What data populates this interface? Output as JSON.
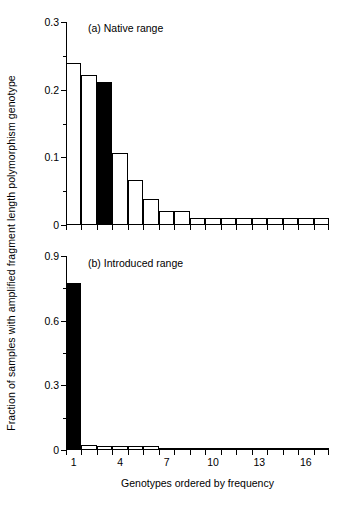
{
  "figure": {
    "ylabel": "Fraction of samples with amplified fragment length polymorphism genotype",
    "xlabel": "Genotypes ordered by frequency"
  },
  "chart_data": [
    {
      "type": "bar",
      "panel": "a",
      "tag": "(a)  Native range",
      "title": "Native range",
      "xlabel": "Genotypes ordered by frequency",
      "ylabel": "Fraction of samples with amplified fragment length polymorphism genotype",
      "categories": [
        1,
        2,
        3,
        4,
        5,
        6,
        7,
        8,
        9,
        10,
        11,
        12,
        13,
        14,
        15,
        16,
        17
      ],
      "values": [
        0.24,
        0.222,
        0.212,
        0.107,
        0.067,
        0.038,
        0.02,
        0.02,
        0.01,
        0.01,
        0.01,
        0.01,
        0.01,
        0.01,
        0.01,
        0.01,
        0.01
      ],
      "fills": [
        "open",
        "open",
        "solid",
        "open",
        "open",
        "open",
        "open",
        "open",
        "open",
        "open",
        "open",
        "open",
        "open",
        "open",
        "open",
        "open",
        "open"
      ],
      "ylim": [
        0,
        0.3
      ],
      "ymajor": [
        0,
        0.1,
        0.2,
        0.3
      ],
      "yticklabels": [
        "0",
        "0.1",
        "0.2",
        "0.3"
      ],
      "yminor": [
        0.05,
        0.15,
        0.25
      ],
      "xlim": [
        0.5,
        17.5
      ],
      "xticks": [
        1,
        2,
        3,
        4,
        5,
        6,
        7,
        8,
        9,
        10,
        11,
        12,
        13,
        14,
        15,
        16,
        17
      ],
      "xticklabels": {
        "1": "1",
        "4": "4",
        "7": "7",
        "10": "10",
        "13": "13",
        "16": "16"
      },
      "grid": false,
      "legend": "none"
    },
    {
      "type": "bar",
      "panel": "b",
      "tag": "(b)  Introduced range",
      "title": "Introduced range",
      "xlabel": "Genotypes ordered by frequency",
      "ylabel": "Fraction of samples with amplified fragment length polymorphism genotype",
      "categories": [
        1,
        2,
        3,
        4,
        5,
        6,
        7,
        8,
        9,
        10,
        11,
        12,
        13,
        14,
        15,
        16,
        17
      ],
      "values": [
        0.775,
        0.022,
        0.02,
        0.017,
        0.017,
        0.017,
        0.01,
        0.01,
        0.008,
        0.008,
        0.006,
        0.006,
        0.005,
        0.004,
        0.004,
        0.004,
        0.004
      ],
      "fills": [
        "solid",
        "open",
        "open",
        "open",
        "open",
        "open",
        "open",
        "open",
        "open",
        "open",
        "open",
        "open",
        "open",
        "open",
        "open",
        "open",
        "open"
      ],
      "ylim": [
        0,
        0.9
      ],
      "ymajor": [
        0,
        0.3,
        0.6,
        0.9
      ],
      "yticklabels": [
        "0",
        "0.3",
        "0.6",
        "0.9"
      ],
      "yminor": [
        0.15,
        0.45,
        0.75
      ],
      "xlim": [
        0.5,
        17.5
      ],
      "xticks": [
        1,
        2,
        3,
        4,
        5,
        6,
        7,
        8,
        9,
        10,
        11,
        12,
        13,
        14,
        15,
        16,
        17
      ],
      "xticklabels": {
        "1": "1",
        "4": "4",
        "7": "7",
        "10": "10",
        "13": "13",
        "16": "16"
      },
      "grid": false,
      "legend": "none"
    }
  ]
}
